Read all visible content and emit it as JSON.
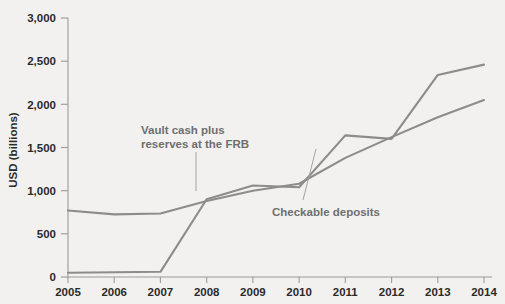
{
  "chart_data": {
    "type": "line",
    "title": "",
    "xlabel": "",
    "ylabel": "USD (billions)",
    "x": [
      2005,
      2006,
      2007,
      2008,
      2009,
      2010,
      2011,
      2012,
      2013,
      2014
    ],
    "xtick_labels": [
      "2005",
      "2006",
      "2007",
      "2008",
      "2009",
      "2010",
      "2011",
      "2012",
      "2013",
      "2014"
    ],
    "ytick_labels": [
      "0",
      "500",
      "1,000",
      "1,500",
      "2,000",
      "2,500",
      "3,000"
    ],
    "yticks": [
      0,
      500,
      1000,
      1500,
      2000,
      2500,
      3000
    ],
    "xlim": [
      2005,
      2014
    ],
    "ylim": [
      0,
      3000
    ],
    "grid": false,
    "legend": "none",
    "series": [
      {
        "name": "Vault cash plus reserves at the FRB",
        "values": [
          50,
          55,
          60,
          900,
          1060,
          1040,
          1640,
          1600,
          2340,
          2460
        ],
        "color": "#8c8c8c"
      },
      {
        "name": "Checkable deposits",
        "values": [
          770,
          725,
          735,
          880,
          1000,
          1080,
          1380,
          1620,
          1850,
          2050
        ],
        "color": "#8c8c8c"
      }
    ],
    "annotations": [
      {
        "id": "vault-cash-annotation",
        "line1": "Vault cash plus",
        "line2": "reserves at the FRB"
      },
      {
        "id": "checkable-deposits-annotation",
        "line1": "Checkable deposits"
      }
    ],
    "colors": {
      "background": "#f2f1ef",
      "line": "#8c8c8c",
      "axis": "#9a9a9a",
      "tick_text": "#2b2b2b",
      "annotation_text": "#6f6f6f"
    }
  }
}
